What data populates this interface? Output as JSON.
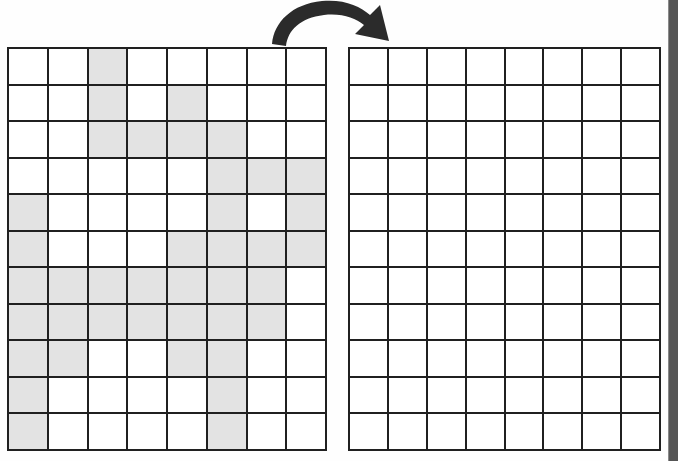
{
  "page": {
    "background_color": "#fefefe",
    "grid_line_color": "#202020",
    "filled_cell_color": "#e3e3e3",
    "empty_cell_color": "#ffffff",
    "arrow_color": "#2b2b2b"
  },
  "arrow": {
    "icon": "curved-arrow-right-icon",
    "direction": "right",
    "label": ""
  },
  "source_grid": {
    "label": "",
    "rows": 11,
    "columns": 8,
    "filled_cells": [
      [
        0,
        0,
        1,
        0,
        0,
        0,
        0,
        0
      ],
      [
        0,
        0,
        1,
        0,
        1,
        0,
        0,
        0
      ],
      [
        0,
        0,
        1,
        1,
        1,
        1,
        0,
        0
      ],
      [
        0,
        0,
        0,
        0,
        0,
        1,
        1,
        1
      ],
      [
        1,
        0,
        0,
        0,
        0,
        1,
        0,
        1
      ],
      [
        1,
        0,
        0,
        0,
        1,
        1,
        1,
        1
      ],
      [
        1,
        1,
        1,
        1,
        1,
        1,
        1,
        0
      ],
      [
        1,
        1,
        1,
        1,
        1,
        1,
        1,
        0
      ],
      [
        1,
        1,
        0,
        0,
        1,
        1,
        0,
        0
      ],
      [
        1,
        0,
        0,
        0,
        0,
        1,
        0,
        0
      ],
      [
        1,
        0,
        0,
        0,
        0,
        1,
        0,
        0
      ]
    ],
    "filled_count": 49
  },
  "target_grid": {
    "label": "",
    "rows": 11,
    "columns": 8,
    "filled_cells": [
      [
        0,
        0,
        0,
        0,
        0,
        0,
        0,
        0
      ],
      [
        0,
        0,
        0,
        0,
        0,
        0,
        0,
        0
      ],
      [
        0,
        0,
        0,
        0,
        0,
        0,
        0,
        0
      ],
      [
        0,
        0,
        0,
        0,
        0,
        0,
        0,
        0
      ],
      [
        0,
        0,
        0,
        0,
        0,
        0,
        0,
        0
      ],
      [
        0,
        0,
        0,
        0,
        0,
        0,
        0,
        0
      ],
      [
        0,
        0,
        0,
        0,
        0,
        0,
        0,
        0
      ],
      [
        0,
        0,
        0,
        0,
        0,
        0,
        0,
        0
      ],
      [
        0,
        0,
        0,
        0,
        0,
        0,
        0,
        0
      ],
      [
        0,
        0,
        0,
        0,
        0,
        0,
        0,
        0
      ],
      [
        0,
        0,
        0,
        0,
        0,
        0,
        0,
        0
      ]
    ],
    "filled_count": 0
  },
  "scrollbar": {
    "orientation": "vertical",
    "thumb_color": "#555555",
    "track_color": "#585858"
  }
}
